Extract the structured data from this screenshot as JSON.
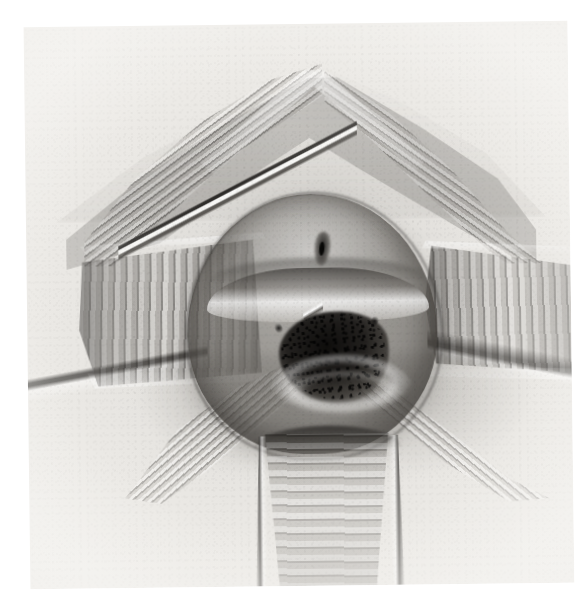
{
  "document": {
    "type": "scanned-illustration",
    "medium": "graphite pencil / charcoal rendering",
    "palette": "grayscale",
    "page_background": "#ffffff",
    "plate_background": "#e6e4e0",
    "ink_dark": "#1a1816",
    "ink_mid": "#6e6b66",
    "highlight": "#fbfaf8"
  },
  "plate": {
    "label": "anatomical-illustration-plate",
    "subject": "surgical field view with retracted tissue walls, central dome and opening, instrument probe inserted",
    "orientation": "slightly rotated scan, tilted about -0.7 degrees"
  },
  "figure": {
    "upper_wall": {
      "name": "upper-retracted-wall",
      "description": "peaked chevron-shaped anterior wall with fine transverse rugae"
    },
    "left_block": {
      "name": "left-lateral-wall",
      "description": "left lateral retracted block with vertical striations"
    },
    "right_block": {
      "name": "right-lateral-wall",
      "description": "right lateral retracted block with vertical striations"
    },
    "lower_wall": {
      "name": "lower-posterior-wall",
      "description": "inferior funnel-shaped wall with horizontal rugae"
    },
    "dome": {
      "name": "central-dome",
      "description": "rounded central tissue mass occupying the middle of the field"
    },
    "shelf": {
      "name": "transverse-shelf",
      "description": "highlighted transverse ridge above the central opening"
    },
    "opening": {
      "name": "central-opening",
      "description": "dark oval aperture at the centre of the dome"
    },
    "meatus": {
      "name": "superior-slit-opening",
      "description": "small dark vertical slit superior to the central opening"
    },
    "probe": {
      "name": "probe-instrument",
      "description": "slender metal sound entering from upper left, tip at the central opening"
    },
    "lower_left_fold": {
      "name": "lower-left-fold-band",
      "description": "granular diagonal fold band in the lower-left quadrant"
    },
    "lower_right_fold": {
      "name": "lower-right-fold-band",
      "description": "granular diagonal fold band in the lower-right quadrant"
    },
    "sweep_left": {
      "name": "left-sweep-line",
      "description": "long contour line sweeping to the left margin"
    },
    "sweep_right": {
      "name": "right-sweep-line",
      "description": "long contour line sweeping to the right margin"
    }
  },
  "artifacts": {
    "ghost_bottom_right": "",
    "ghost_bottom_left": ""
  }
}
